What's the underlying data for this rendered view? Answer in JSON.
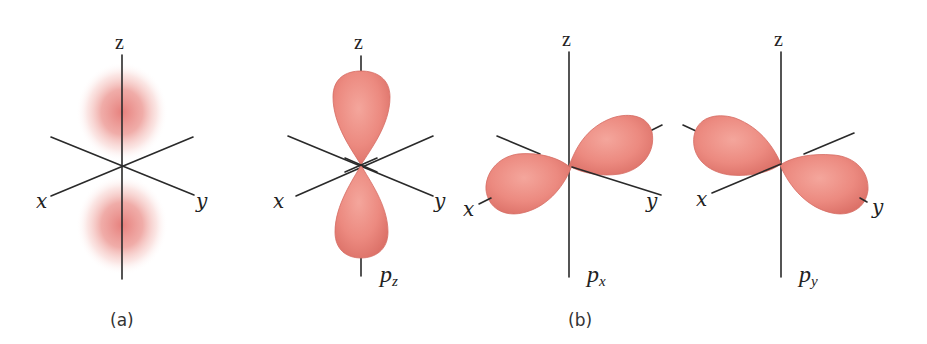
{
  "figure": {
    "colors": {
      "lobe_fill": "#ec8a80",
      "lobe_highlight": "#f4a69c",
      "lobe_edge": "#d66c63",
      "cloud_core": "#e26a66",
      "axis": "#2a2a2a",
      "background": "#ffffff"
    },
    "panel_a": {
      "caption": "(a)",
      "description": "electron density cloud",
      "axes": {
        "x": "x",
        "y": "y",
        "z": "z"
      }
    },
    "panel_b": {
      "caption": "(b)",
      "orbitals": [
        {
          "name": "p",
          "subscript": "z",
          "axes": {
            "x": "x",
            "y": "y",
            "z": "z"
          }
        },
        {
          "name": "p",
          "subscript": "x",
          "axes": {
            "x": "x",
            "y": "y",
            "z": "z"
          }
        },
        {
          "name": "p",
          "subscript": "y",
          "axes": {
            "x": "x",
            "y": "y",
            "z": "z"
          }
        }
      ]
    }
  }
}
